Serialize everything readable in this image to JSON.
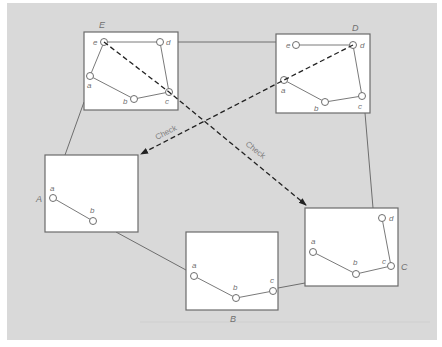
{
  "diagram": {
    "background_color": "#d9d9d9",
    "boxes": [
      {
        "id": "E",
        "label": "E",
        "nodes": [
          "e",
          "d",
          "a",
          "b",
          "c"
        ]
      },
      {
        "id": "D",
        "label": "D",
        "nodes": [
          "e",
          "d",
          "a",
          "b",
          "c"
        ]
      },
      {
        "id": "A",
        "label": "A",
        "nodes": [
          "a",
          "b"
        ]
      },
      {
        "id": "B",
        "label": "B",
        "nodes": [
          "a",
          "b",
          "c"
        ]
      },
      {
        "id": "C",
        "label": "C",
        "nodes": [
          "a",
          "b",
          "c",
          "d"
        ]
      }
    ],
    "box_E": {
      "label": "E",
      "n_e": "e",
      "n_d": "d",
      "n_a": "a",
      "n_b": "b",
      "n_c": "c"
    },
    "box_D": {
      "label": "D",
      "n_e": "e",
      "n_d": "d",
      "n_a": "a",
      "n_b": "b",
      "n_c": "c"
    },
    "box_A": {
      "label": "A",
      "n_a": "a",
      "n_b": "b"
    },
    "box_B": {
      "label": "B",
      "n_a": "a",
      "n_b": "b",
      "n_c": "c"
    },
    "box_C": {
      "label": "C",
      "n_a": "a",
      "n_b": "b",
      "n_c": "c",
      "n_d": "d"
    },
    "cycle_connections": [
      "E-D",
      "D-C",
      "C-B",
      "B-A",
      "A-E"
    ],
    "check_arrows": [
      {
        "from": "E",
        "to": "C",
        "label": "Check"
      },
      {
        "from": "D",
        "to": "A",
        "label": "Check"
      }
    ],
    "check_label_1": "Check",
    "check_label_2": "Check"
  }
}
